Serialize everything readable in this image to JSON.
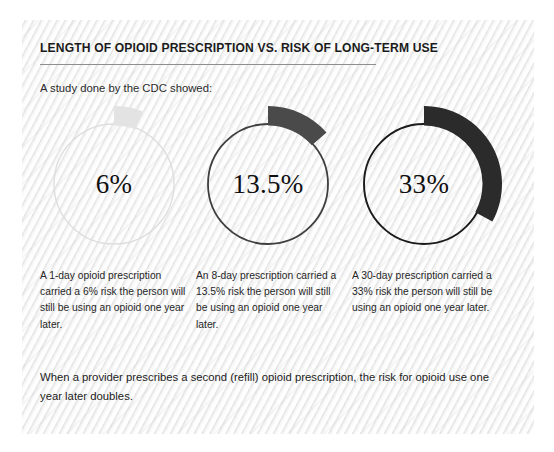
{
  "header": {
    "title": "LENGTH OF OPIOID PRESCRIPTION VS. RISK OF LONG-TERM USE",
    "subtitle": "A study done by the CDC showed:"
  },
  "footer": {
    "text": "When a provider prescribes a second (refill) opioid prescription, the risk for opioid use one year later doubles."
  },
  "chart_data": {
    "type": "pie",
    "title": "LENGTH OF OPIOID PRESCRIPTION VS. RISK OF LONG-TERM USE",
    "subtitle": "A study done by the CDC showed:",
    "categories": [
      "1-day prescription",
      "8-day prescription",
      "30-day prescription"
    ],
    "values": [
      6,
      13.5,
      33
    ],
    "unit": "%",
    "ylabel": "Risk of still using opioid one year later",
    "xlabel": "",
    "grid": false,
    "legend": false,
    "donuts": [
      {
        "label": "6%",
        "value": 6,
        "arc_color": "#e3e3e3",
        "ring_color": "#dedede",
        "caption": "A 1-day opioid prescription carried a 6% risk the person will still be using an opioid one year later."
      },
      {
        "label": "13.5%",
        "value": 13.5,
        "arc_color": "#4a4a4a",
        "ring_color": "#3f3f3f",
        "caption": "An 8-day prescription carried a 13.5% risk the person will still be using an opioid one year later."
      },
      {
        "label": "33%",
        "value": 33,
        "arc_color": "#2b2b2b",
        "ring_color": "#1a1a1a",
        "caption": "A 30-day prescription carried a 33% risk the person will still be using an opioid one year later."
      }
    ]
  },
  "colors": {
    "panel_background": "#f4f4f4",
    "title_text": "#1b1b1b",
    "body_text": "#262626",
    "rule": "#8e8e8e"
  }
}
